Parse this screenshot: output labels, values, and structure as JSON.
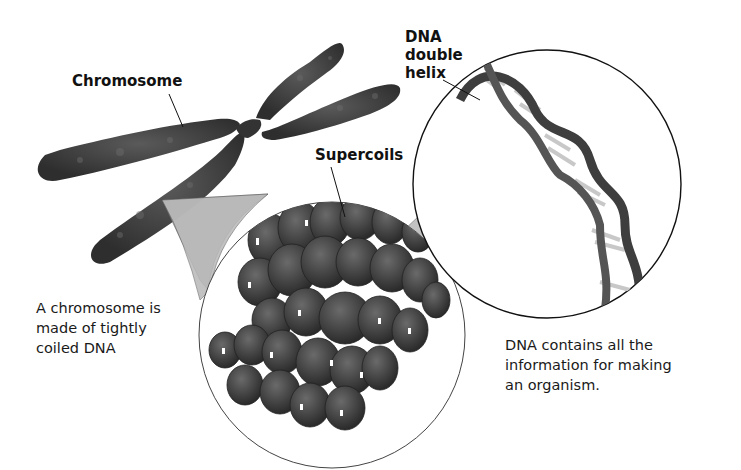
{
  "diagram": {
    "labels": {
      "chromosome": "Chromosome",
      "supercoils": "Supercoils",
      "dna_helix": [
        "DNA",
        "double",
        "helix"
      ]
    },
    "captions": {
      "chromosome_caption": [
        "A chromosome is",
        "made of tightly",
        "coiled DNA"
      ],
      "dna_caption": [
        "DNA contains all the",
        "information for making",
        "an organism."
      ]
    },
    "colors": {
      "background": "#ffffff",
      "chromosome": "#3a3a3a",
      "supercoil": "#4a4a4a",
      "zoom_wedge": "#b8b8b8",
      "circle_outline": "#222222",
      "text": "#111111"
    }
  }
}
